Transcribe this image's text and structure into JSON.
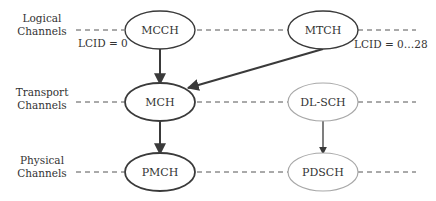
{
  "layers": [
    {
      "id": "logical",
      "label_line1": "Logical",
      "label_line2": "Channels"
    },
    {
      "id": "transport",
      "label_line1": "Transport",
      "label_line2": "Channels"
    },
    {
      "id": "physical",
      "label_line1": "Physical",
      "label_line2": "Channels"
    }
  ],
  "nodes": {
    "mcch": {
      "label": "MCCH",
      "style": "dark"
    },
    "mtch": {
      "label": "MTCH",
      "style": "dark"
    },
    "mch": {
      "label": "MCH",
      "style": "dark"
    },
    "dlsch": {
      "label": "DL-SCH",
      "style": "light"
    },
    "pmch": {
      "label": "PMCH",
      "style": "dark"
    },
    "pdsch": {
      "label": "PDSCH",
      "style": "light"
    }
  },
  "annotations": {
    "mcch_lcid": "LCID = 0",
    "mtch_lcid": "LCID = 0…28"
  },
  "edges": [
    {
      "from": "MCCH",
      "to": "MCH"
    },
    {
      "from": "MTCH",
      "to": "MCH"
    },
    {
      "from": "MCH",
      "to": "PMCH"
    },
    {
      "from": "DL-SCH",
      "to": "PDSCH"
    }
  ],
  "colors": {
    "dark_stroke": "#3a3a3a",
    "light_stroke": "#a8a8a8",
    "text": "#333333"
  }
}
